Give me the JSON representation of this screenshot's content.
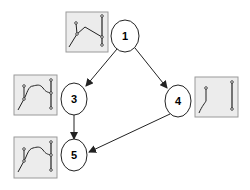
{
  "diagram": {
    "type": "directed-graph",
    "colors": {
      "stroke": "#222222",
      "node_fill": "#ffffff",
      "thumb_fill": "#ececec",
      "thumb_border": "#9a9a9a"
    },
    "nodes": [
      {
        "id": "1",
        "label": "1",
        "cx": 125,
        "cy": 36
      },
      {
        "id": "3",
        "label": "3",
        "cx": 74,
        "cy": 99
      },
      {
        "id": "4",
        "label": "4",
        "cx": 178,
        "cy": 101
      },
      {
        "id": "5",
        "label": "5",
        "cx": 74,
        "cy": 155
      }
    ],
    "edges": [
      {
        "from": "1",
        "to": "3"
      },
      {
        "from": "1",
        "to": "4"
      },
      {
        "from": "3",
        "to": "5"
      },
      {
        "from": "4",
        "to": "5"
      }
    ],
    "thumbnails": [
      {
        "node": "1",
        "x": 66,
        "y": 12,
        "w": 42,
        "h": 40
      },
      {
        "node": "3",
        "x": 14,
        "y": 75,
        "w": 43,
        "h": 40
      },
      {
        "node": "4",
        "x": 195,
        "y": 77,
        "w": 43,
        "h": 40
      },
      {
        "node": "5",
        "x": 14,
        "y": 137,
        "w": 43,
        "h": 41
      }
    ]
  }
}
